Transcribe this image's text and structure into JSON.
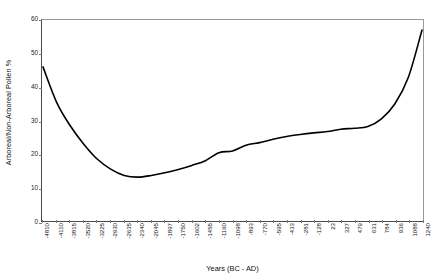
{
  "chart_data": {
    "type": "line",
    "title": "",
    "subtitle": "",
    "xlabel": "Years (BC - AD)",
    "ylabel": "Arboreal/Non-Arboreal Pollen %",
    "ylim": [
      0,
      60
    ],
    "yticks": [
      0,
      10,
      20,
      30,
      40,
      50,
      60
    ],
    "grid": false,
    "legend": null,
    "line_color": "#000000",
    "line_width": 1.6,
    "categories": [
      "-4810",
      "-4110",
      "-3815",
      "-3520",
      "-3225",
      "-2930",
      "-2635",
      "-2340",
      "-2045",
      "-1897",
      "-1750",
      "-1602",
      "-1455",
      "-1160",
      "-1098",
      "-893",
      "-770",
      "-595",
      "-433",
      "-281",
      "-128",
      "23",
      "327",
      "479",
      "631",
      "784",
      "936",
      "1088",
      "1240"
    ],
    "values": [
      46.0,
      35.5,
      28.5,
      23.0,
      18.5,
      15.5,
      13.6,
      13.1,
      13.6,
      14.4,
      15.4,
      16.6,
      18.0,
      20.4,
      20.9,
      22.6,
      23.4,
      24.4,
      25.2,
      25.8,
      26.3,
      26.7,
      27.4,
      27.7,
      28.2,
      30.5,
      35.0,
      43.0,
      57.0
    ],
    "series": [
      {
        "name": "Arboreal/Non-Arboreal Pollen %",
        "values": [
          46.0,
          35.5,
          28.5,
          23.0,
          18.5,
          15.5,
          13.6,
          13.1,
          13.6,
          14.4,
          15.4,
          16.6,
          18.0,
          20.4,
          20.9,
          22.6,
          23.4,
          24.4,
          25.2,
          25.8,
          26.3,
          26.7,
          27.4,
          27.7,
          28.2,
          30.5,
          35.0,
          43.0,
          57.0
        ]
      }
    ]
  },
  "axes": {
    "y_title": "Arboreal/Non-Arboreal Pollen %",
    "x_title": "Years (BC - AD)"
  }
}
